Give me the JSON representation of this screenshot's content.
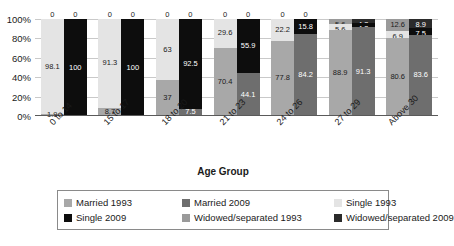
{
  "chart_data": {
    "type": "bar",
    "subtype": "stacked-percent-grouped",
    "title": "",
    "xlabel": "Age Group",
    "ylabel": "",
    "ylim": [
      0,
      100
    ],
    "y_ticks": [
      "0%",
      "20%",
      "40%",
      "60%",
      "80%",
      "100%"
    ],
    "grid": true,
    "legend_position": "bottom",
    "categories": [
      "0 to 14",
      "15 to 17",
      "18 to 20",
      "21 to 23",
      "24 to 26",
      "27 to 29",
      "Above 30"
    ],
    "legend": [
      {
        "name": "Married 1993",
        "color": "#a8a8a8"
      },
      {
        "name": "Married 2009",
        "color": "#6e6e6e"
      },
      {
        "name": "Single 1993",
        "color": "#e4e4e4"
      },
      {
        "name": "Single  2009",
        "color": "#0d0d0d"
      },
      {
        "name": "Widowed/separated 1993",
        "color": "#9a9a9a"
      },
      {
        "name": "Widowed/separated 2009",
        "color": "#2b2b2b"
      }
    ],
    "series": [
      {
        "name": "Married 1993",
        "values": [
          1.9,
          8.7,
          37,
          70.4,
          77.8,
          88.9,
          80.6
        ]
      },
      {
        "name": "Married 2009",
        "values": [
          0,
          0,
          7.5,
          44.1,
          84.2,
          91.3,
          83.6
        ]
      },
      {
        "name": "Single 1993",
        "values": [
          98.1,
          91.3,
          63,
          29.6,
          22.2,
          5.6,
          12.6
        ]
      },
      {
        "name": "Single  2009",
        "values": [
          100,
          100,
          92.5,
          55.9,
          15.8,
          4.3,
          8.9
        ]
      },
      {
        "name": "Widowed/separated 1993",
        "values": [
          0,
          0,
          0,
          0,
          0,
          5.6,
          6.9
        ]
      },
      {
        "name": "Widowed/separated 2009",
        "values": [
          0,
          0,
          0,
          0,
          0,
          4.3,
          7.5
        ]
      }
    ],
    "bars": [
      {
        "group": "0 to 14",
        "bar_1993": [
          {
            "key": "single93",
            "label": "0",
            "value": 0,
            "cls": "c-s09",
            "zero": true
          },
          {
            "key": "single93",
            "label": "98.1",
            "value": 98.1,
            "cls": "c-s93"
          },
          {
            "key": "married93",
            "label": "1.9",
            "value": 1.9,
            "cls": "c-m93"
          }
        ],
        "bar_2009": [
          {
            "key": "zero09",
            "label": "0",
            "value": 0,
            "cls": "c-w09",
            "zero": true
          },
          {
            "key": "single09",
            "label": "100",
            "value": 100,
            "cls": "c-s09"
          }
        ]
      },
      {
        "group": "15 to 17",
        "bar_1993": [
          {
            "key": "top",
            "label": "0",
            "value": 0,
            "cls": "c-s09",
            "zero": true
          },
          {
            "key": "single93",
            "label": "91.3",
            "value": 91.3,
            "cls": "c-s93"
          },
          {
            "key": "married93",
            "label": "8.7",
            "value": 8.7,
            "cls": "c-m93"
          }
        ],
        "bar_2009": [
          {
            "key": "top",
            "label": "0",
            "value": 0,
            "cls": "c-w09",
            "zero": true
          },
          {
            "key": "single09",
            "label": "100",
            "value": 100,
            "cls": "c-s09"
          }
        ]
      },
      {
        "group": "18 to 20",
        "bar_1993": [
          {
            "key": "top",
            "label": "0",
            "value": 0,
            "cls": "c-s09",
            "zero": true
          },
          {
            "key": "single93",
            "label": "63",
            "value": 63,
            "cls": "c-s93"
          },
          {
            "key": "married93",
            "label": "37",
            "value": 37,
            "cls": "c-m93"
          }
        ],
        "bar_2009": [
          {
            "key": "top",
            "label": "0",
            "value": 0,
            "cls": "c-w09",
            "zero": true
          },
          {
            "key": "single09",
            "label": "92.5",
            "value": 92.5,
            "cls": "c-s09"
          },
          {
            "key": "married09",
            "label": "7.5",
            "value": 7.5,
            "cls": "c-m09"
          }
        ]
      },
      {
        "group": "21 to 23",
        "bar_1993": [
          {
            "key": "top",
            "label": "0",
            "value": 0,
            "cls": "c-s09",
            "zero": true
          },
          {
            "key": "single93",
            "label": "29.6",
            "value": 29.6,
            "cls": "c-s93"
          },
          {
            "key": "married93",
            "label": "70.4",
            "value": 70.4,
            "cls": "c-m93"
          }
        ],
        "bar_2009": [
          {
            "key": "top",
            "label": "0",
            "value": 0,
            "cls": "c-w09",
            "zero": true
          },
          {
            "key": "single09",
            "label": "55.9",
            "value": 55.9,
            "cls": "c-s09"
          },
          {
            "key": "married09",
            "label": "44.1",
            "value": 44.1,
            "cls": "c-m09"
          }
        ]
      },
      {
        "group": "24 to 26",
        "bar_1993": [
          {
            "key": "top",
            "label": "0",
            "value": 0,
            "cls": "c-s09",
            "zero": true
          },
          {
            "key": "single93",
            "label": "22.2",
            "value": 22.2,
            "cls": "c-s93"
          },
          {
            "key": "married93",
            "label": "77.8",
            "value": 77.8,
            "cls": "c-m93"
          }
        ],
        "bar_2009": [
          {
            "key": "top",
            "label": "0",
            "value": 0,
            "cls": "c-w09",
            "zero": true
          },
          {
            "key": "single09",
            "label": "15.8",
            "value": 15.8,
            "cls": "c-s09"
          },
          {
            "key": "married09",
            "label": "84.2",
            "value": 84.2,
            "cls": "c-m09"
          }
        ]
      },
      {
        "group": "27 to 29",
        "bar_1993": [
          {
            "key": "wid93",
            "label": "5.6",
            "value": 5.6,
            "cls": "c-w93",
            "tiny": true
          },
          {
            "key": "single93",
            "label": "5.6",
            "value": 5.6,
            "cls": "c-s93",
            "tiny": true
          },
          {
            "key": "married93",
            "label": "88.9",
            "value": 88.9,
            "cls": "c-m93"
          }
        ],
        "bar_2009": [
          {
            "key": "wid09",
            "label": "4.3",
            "value": 4.3,
            "cls": "c-w09",
            "tiny": true
          },
          {
            "key": "single09",
            "label": "4.3",
            "value": 4.3,
            "cls": "c-s09",
            "tiny": true
          },
          {
            "key": "married09",
            "label": "91.3",
            "value": 91.3,
            "cls": "c-m09"
          }
        ]
      },
      {
        "group": "Above 30",
        "bar_1993": [
          {
            "key": "wid93",
            "label": "12.6",
            "value": 12.6,
            "cls": "c-w93",
            "tiny": true
          },
          {
            "key": "single93",
            "label": "6.9",
            "value": 6.9,
            "cls": "c-s93",
            "tiny": true
          },
          {
            "key": "married93",
            "label": "80.6",
            "value": 80.6,
            "cls": "c-m93"
          }
        ],
        "bar_2009": [
          {
            "key": "wid09",
            "label": "8.9",
            "value": 8.9,
            "cls": "c-w09",
            "tiny": true
          },
          {
            "key": "single09",
            "label": "7.5",
            "value": 7.5,
            "cls": "c-s09",
            "tiny": true
          },
          {
            "key": "married09",
            "label": "83.6",
            "value": 83.6,
            "cls": "c-m09"
          }
        ]
      }
    ]
  },
  "caption": ""
}
